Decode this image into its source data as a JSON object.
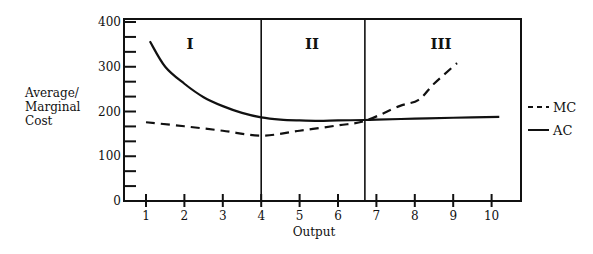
{
  "chart_data": {
    "type": "line",
    "title": "",
    "xlabel": "Output",
    "ylabel": "Average/ Marginal Cost",
    "ylabel_lines": [
      "Average/",
      "Marginal",
      "Cost"
    ],
    "xlim": [
      0.5,
      11
    ],
    "ylim": [
      0,
      400
    ],
    "x_ticks": [
      1,
      2,
      3,
      4,
      5,
      6,
      7,
      8,
      9,
      10
    ],
    "x_tick_labels": [
      "1",
      "2",
      "3",
      "4",
      "5",
      "6",
      "7",
      "8",
      "9",
      "10"
    ],
    "y_ticks": [
      0,
      100,
      200,
      300,
      400
    ],
    "y_tick_labels": [
      "0",
      "100",
      "200",
      "300",
      "400"
    ],
    "y_minor_tick_step": 33.33,
    "grid": false,
    "legend_position": "right",
    "regions": [
      {
        "label": "I",
        "x_start": 1,
        "x_end": 4
      },
      {
        "label": "II",
        "x_start": 4,
        "x_end": 6.7
      },
      {
        "label": "III",
        "x_start": 6.7,
        "x_end": 10.5
      }
    ],
    "region_dividers": [
      4,
      6.7
    ],
    "series": [
      {
        "name": "MC",
        "style": "dashed",
        "x": [
          1,
          2,
          3,
          4,
          5,
          6,
          6.7,
          7.6,
          8.1,
          8.5,
          9.1
        ],
        "values": [
          176,
          167,
          157,
          146,
          157,
          169,
          179,
          212,
          226,
          262,
          308
        ]
      },
      {
        "name": "AC",
        "style": "solid",
        "x": [
          1.1,
          1.5,
          2,
          2.5,
          3,
          3.5,
          4,
          4.5,
          5,
          5.5,
          6,
          6.7,
          7,
          8,
          9,
          10.2
        ],
        "values": [
          357,
          300,
          262,
          232,
          212,
          197,
          187,
          182,
          180,
          179,
          180,
          181,
          182,
          184,
          186,
          188
        ]
      }
    ]
  }
}
